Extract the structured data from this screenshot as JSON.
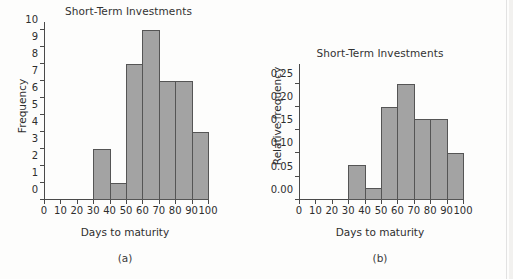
{
  "figures": [
    {
      "key": "a",
      "caption": "(a)",
      "chart_data": {
        "type": "bar",
        "title": "Short-Term Investments",
        "xlabel": "Days to maturity",
        "ylabel": "Frequency",
        "categories": [
          "30-40",
          "40-50",
          "50-60",
          "60-70",
          "70-80",
          "80-90",
          "90-100"
        ],
        "bin_edges": [
          30,
          40,
          50,
          60,
          70,
          80,
          90,
          100
        ],
        "values": [
          3,
          1,
          8,
          10,
          7,
          7,
          4
        ],
        "xlim": [
          0,
          100
        ],
        "ylim": [
          0,
          10
        ],
        "xticks": [
          0,
          10,
          20,
          30,
          40,
          50,
          60,
          70,
          80,
          90,
          100
        ],
        "xtick_labels": [
          "0",
          "10",
          "20",
          "30",
          "40",
          "50",
          "60",
          "70",
          "80",
          "90",
          "100"
        ],
        "yticks": [
          0,
          1,
          2,
          3,
          4,
          5,
          6,
          7,
          8,
          9,
          10
        ],
        "ytick_labels": [
          "0",
          "1",
          "2",
          "3",
          "4",
          "5",
          "6",
          "7",
          "8",
          "9",
          "10"
        ],
        "grid": false,
        "legend": false,
        "bar_fill": "#a3a3a3",
        "bar_edge": "#555555"
      }
    },
    {
      "key": "b",
      "caption": "(b)",
      "chart_data": {
        "type": "bar",
        "title": "Short-Term Investments",
        "xlabel": "Days to maturity",
        "ylabel": "Relative frequency",
        "categories": [
          "30-40",
          "40-50",
          "50-60",
          "60-70",
          "70-80",
          "80-90",
          "90-100"
        ],
        "bin_edges": [
          30,
          40,
          50,
          60,
          70,
          80,
          90,
          100
        ],
        "values": [
          0.075,
          0.025,
          0.2,
          0.25,
          0.175,
          0.175,
          0.1
        ],
        "xlim": [
          0,
          100
        ],
        "ylim": [
          0,
          0.275
        ],
        "xticks": [
          0,
          10,
          20,
          30,
          40,
          50,
          60,
          70,
          80,
          90,
          100
        ],
        "xtick_labels": [
          "0",
          "10",
          "20",
          "30",
          "40",
          "50",
          "60",
          "70",
          "80",
          "90",
          "100"
        ],
        "yticks": [
          0,
          0.05,
          0.1,
          0.15,
          0.2,
          0.25
        ],
        "ytick_labels": [
          "0.00",
          "0.05",
          "0.10",
          "0.15",
          "0.20",
          "0.25"
        ],
        "grid": false,
        "legend": false,
        "bar_fill": "#a3a3a3",
        "bar_edge": "#555555"
      }
    }
  ]
}
